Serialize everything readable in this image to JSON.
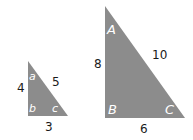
{
  "diagram": {
    "fill_color": "#8c8c8c",
    "small_triangle": {
      "vertices": {
        "top": [
          28,
          61
        ],
        "bottom_left": [
          28,
          116
        ],
        "bottom_right": [
          68,
          116
        ]
      },
      "angles": {
        "top": "a",
        "bottom_left": "b",
        "bottom_right": "c"
      },
      "sides": {
        "vertical": "4",
        "hypotenuse": "5",
        "base": "3"
      }
    },
    "large_triangle": {
      "vertices": {
        "top": [
          105,
          6
        ],
        "bottom_left": [
          105,
          118
        ],
        "bottom_right": [
          185,
          118
        ]
      },
      "angles": {
        "top": "A",
        "bottom_left": "B",
        "bottom_right": "C"
      },
      "sides": {
        "vertical": "8",
        "hypotenuse": "10",
        "base": "6"
      }
    }
  }
}
